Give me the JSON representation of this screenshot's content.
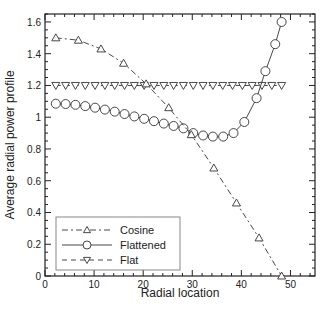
{
  "chart_data": {
    "type": "line",
    "title": "",
    "xlabel": "Radial location",
    "ylabel": "Average radial power profile",
    "xlim": [
      0,
      55
    ],
    "ylim": [
      0,
      1.65
    ],
    "xticks": [
      0,
      10,
      20,
      30,
      40,
      50
    ],
    "xtick_labels": [
      "0",
      "10",
      "20",
      "30",
      "40",
      "50"
    ],
    "yticks": [
      0,
      0.2,
      0.4,
      0.6,
      0.8,
      1.0,
      1.2,
      1.4,
      1.6
    ],
    "ytick_labels": [
      "0",
      "0.2",
      "0.4",
      "0.6",
      "0.8",
      "1",
      "1.2",
      "1.4",
      "1.6"
    ],
    "grid": false,
    "legend_position": "lower left",
    "series": [
      {
        "name": "Cosine",
        "line_style": "dash-dot",
        "marker": "triangle-up",
        "x": [
          2.2,
          6.8,
          11.4,
          16.0,
          20.6,
          25.2,
          29.8,
          34.4,
          39.0,
          43.6,
          48.2
        ],
        "y": [
          1.5,
          1.485,
          1.43,
          1.34,
          1.21,
          1.06,
          0.89,
          0.68,
          0.46,
          0.24,
          0.0
        ]
      },
      {
        "name": "Flattened",
        "line_style": "solid",
        "marker": "circle",
        "x": [
          2.2,
          4.2,
          6.2,
          8.2,
          10.2,
          12.2,
          14.2,
          16.2,
          18.2,
          20.2,
          22.2,
          24.2,
          26.2,
          28.2,
          30.2,
          32.2,
          34.2,
          36.3,
          38.4,
          40.6,
          43.1,
          44.9,
          46.9,
          48.2
        ],
        "y": [
          1.085,
          1.083,
          1.078,
          1.07,
          1.06,
          1.048,
          1.035,
          1.02,
          1.005,
          0.99,
          0.975,
          0.96,
          0.945,
          0.93,
          0.9,
          0.885,
          0.878,
          0.878,
          0.9,
          0.97,
          1.12,
          1.29,
          1.46,
          1.6
        ]
      },
      {
        "name": "Flat",
        "line_style": "dashed",
        "marker": "triangle-down",
        "x": [
          2.2,
          4.2,
          6.2,
          8.2,
          10.2,
          12.2,
          14.2,
          16.2,
          18.2,
          20.2,
          22.2,
          24.2,
          26.2,
          28.2,
          30.2,
          32.2,
          34.2,
          36.2,
          38.2,
          40.2,
          42.2,
          44.2,
          46.2,
          48.2
        ],
        "y": [
          1.2,
          1.2,
          1.2,
          1.2,
          1.2,
          1.2,
          1.2,
          1.2,
          1.2,
          1.2,
          1.2,
          1.2,
          1.2,
          1.2,
          1.2,
          1.2,
          1.2,
          1.2,
          1.2,
          1.2,
          1.2,
          1.2,
          1.2,
          1.2
        ]
      }
    ]
  },
  "colors": {
    "line": "#333333",
    "frame": "#222222",
    "legend_border": "#888888",
    "background": "#ffffff"
  }
}
